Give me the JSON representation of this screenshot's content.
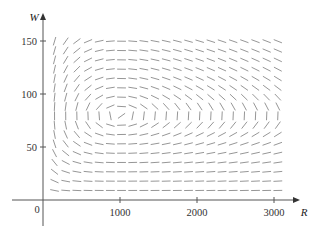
{
  "chart_data": {
    "type": "direction_field",
    "title": "",
    "xlabel": "R",
    "ylabel": "W",
    "origin_label": "0",
    "xlim": [
      0,
      3300
    ],
    "ylim": [
      0,
      175
    ],
    "xticks": [
      1000,
      2000,
      3000
    ],
    "xtick_labels": [
      "1000",
      "2000",
      "3000"
    ],
    "yticks": [
      50,
      100,
      150
    ],
    "ytick_labels": [
      "50",
      "100",
      "150"
    ],
    "grid": false,
    "legend": null,
    "system": {
      "dR_dt": "0.08 R - 0.001 R W",
      "dW_dt": "-0.02 W + 0.00002 R W",
      "coefficients": {
        "a": 0.08,
        "b": 0.001,
        "c": 0.02,
        "d": 2e-05
      }
    },
    "equilibrium": {
      "R": 1000,
      "W": 80
    },
    "field_grid": {
      "R_start": 150,
      "R_step": 145,
      "R_count": 21,
      "W_start": 9,
      "W_step": 8.8,
      "W_count": 17
    },
    "colors": {
      "segment": "#8a8a8a",
      "axis": "#555555",
      "text": "#333333"
    }
  }
}
